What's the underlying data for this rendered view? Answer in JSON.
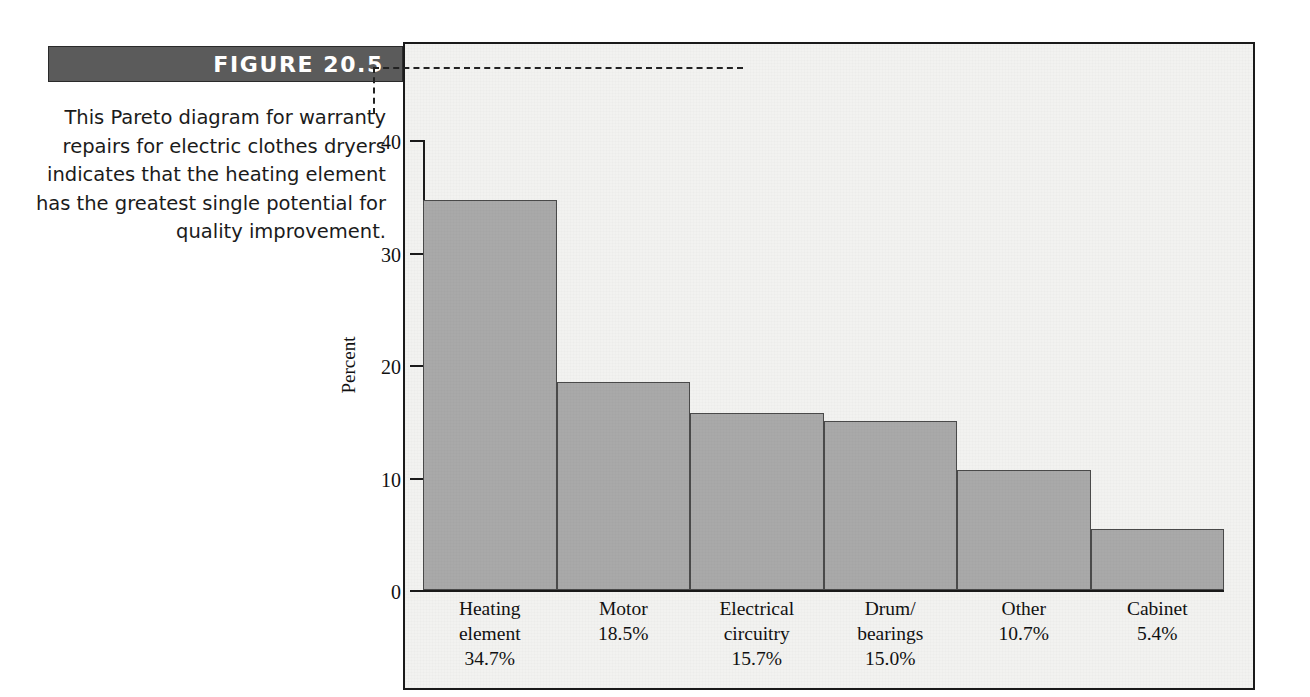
{
  "figure": {
    "banner_label": "FIGURE 20.5",
    "caption": "This Pareto diagram for warranty repairs for electric clothes dryers indicates that the heating element has the greatest single potential for quality improvement.",
    "banner_bg_color": "#5b5b5b",
    "banner_text_color": "#ffffff",
    "panel_bg_color": "#f2f2f0",
    "frame_color": "#1a1a1a"
  },
  "chart_data": {
    "type": "bar",
    "title": "",
    "subtitle": "",
    "xlabel": "",
    "ylabel": "Percent",
    "categories": [
      "Heating\nelement",
      "Motor",
      "Electrical\ncircuitry",
      "Drum/\nbearings",
      "Other",
      "Cabinet"
    ],
    "values": [
      34.7,
      18.5,
      15.7,
      15.0,
      10.7,
      5.4
    ],
    "data_labels": [
      "34.7%",
      "18.5%",
      "15.7%",
      "15.0%",
      "10.7%",
      "5.4%"
    ],
    "ylim": [
      0,
      40
    ],
    "yticks": [
      0,
      10,
      20,
      30,
      40
    ],
    "ytick_labels": [
      "0",
      "10",
      "20",
      "30",
      "40"
    ],
    "grid": false,
    "legend": false,
    "bar_fill_color": "#a9a9a9",
    "bar_edge_color": "#4a4a4a",
    "bars_adjacent": true
  }
}
